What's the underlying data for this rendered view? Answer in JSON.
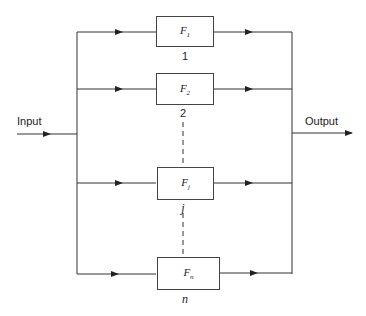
{
  "diagram": {
    "input_label": "Input",
    "output_label": "Output",
    "blocks": [
      {
        "name": "F",
        "sub": "1",
        "index": "1"
      },
      {
        "name": "F",
        "sub": "2",
        "index": "2"
      },
      {
        "name": "F",
        "sub": "j",
        "index": "j"
      },
      {
        "name": "F",
        "sub": "n",
        "index": "n"
      }
    ],
    "colors": {
      "line": "#333333",
      "box_border": "#444444"
    }
  }
}
